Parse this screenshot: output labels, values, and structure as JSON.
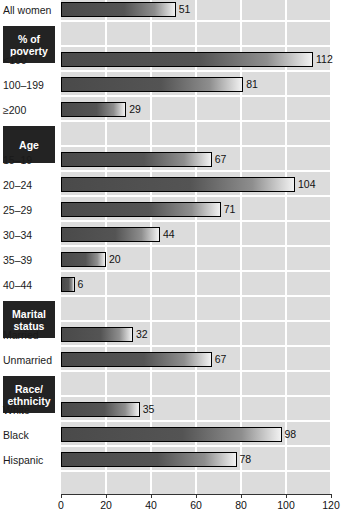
{
  "chart_data": {
    "type": "bar",
    "orientation": "horizontal",
    "title": "",
    "xlabel": "",
    "ylabel": "",
    "xlim": [
      0,
      120
    ],
    "xticks": [
      0,
      20,
      40,
      60,
      80,
      100,
      120
    ],
    "grid": true,
    "legend": null,
    "categories": [
      "All women",
      "<100",
      "100–199",
      "≥200",
      "15–19",
      "20–24",
      "25–29",
      "30–34",
      "35–39",
      "40–44",
      "Married",
      "Unmarried",
      "White",
      "Black",
      "Hispanic"
    ],
    "values": [
      51,
      112,
      81,
      29,
      67,
      104,
      71,
      44,
      20,
      6,
      32,
      67,
      35,
      98,
      78
    ],
    "group_headers": [
      "% of poverty",
      "Age",
      "Marital status",
      "Race/ethnicity"
    ],
    "groups": [
      {
        "header": null,
        "categories": [
          "All women"
        ],
        "values": [
          51
        ]
      },
      {
        "header": "% of poverty",
        "categories": [
          "<100",
          "100–199",
          "≥200"
        ],
        "values": [
          112,
          81,
          29
        ]
      },
      {
        "header": "Age",
        "categories": [
          "15–19",
          "20–24",
          "25–29",
          "30–34",
          "35–39",
          "40–44"
        ],
        "values": [
          67,
          104,
          71,
          44,
          20,
          6
        ]
      },
      {
        "header": "Marital status",
        "categories": [
          "Married",
          "Unmarried"
        ],
        "values": [
          32,
          67
        ]
      },
      {
        "header": "Race/ethnicity",
        "categories": [
          "White",
          "Black",
          "Hispanic"
        ],
        "values": [
          35,
          98,
          78
        ]
      }
    ]
  },
  "rows": [
    {
      "label": "All women",
      "value": "51",
      "kind": "bar"
    },
    {
      "label": "% of poverty",
      "value": "",
      "kind": "header",
      "line1": "% of",
      "line2": "poverty"
    },
    {
      "label": "<100",
      "value": "112",
      "kind": "bar"
    },
    {
      "label": "100–199",
      "value": "81",
      "kind": "bar"
    },
    {
      "label": "≥200",
      "value": "29",
      "kind": "bar"
    },
    {
      "label": "Age",
      "value": "",
      "kind": "header",
      "line1": "Age",
      "line2": ""
    },
    {
      "label": "15–19",
      "value": "67",
      "kind": "bar"
    },
    {
      "label": "20–24",
      "value": "104",
      "kind": "bar"
    },
    {
      "label": "25–29",
      "value": "71",
      "kind": "bar"
    },
    {
      "label": "30–34",
      "value": "44",
      "kind": "bar"
    },
    {
      "label": "35–39",
      "value": "20",
      "kind": "bar"
    },
    {
      "label": "40–44",
      "value": "6",
      "kind": "bar"
    },
    {
      "label": "Marital status",
      "value": "",
      "kind": "header",
      "line1": "Marital",
      "line2": "status"
    },
    {
      "label": "Married",
      "value": "32",
      "kind": "bar"
    },
    {
      "label": "Unmarried",
      "value": "67",
      "kind": "bar"
    },
    {
      "label": "Race/ethnicity",
      "value": "",
      "kind": "header",
      "line1": "Race/",
      "line2": "ethnicity"
    },
    {
      "label": "White",
      "value": "35",
      "kind": "bar"
    },
    {
      "label": "Black",
      "value": "98",
      "kind": "bar"
    },
    {
      "label": "Hispanic",
      "value": "78",
      "kind": "bar"
    }
  ],
  "axis": {
    "ticks": [
      "0",
      "20",
      "40",
      "60",
      "80",
      "100",
      "120"
    ]
  },
  "colors": {
    "plot_background": "#dcdcdc",
    "gridline": "#ffffff",
    "header_box": "#232323",
    "header_text": "#ffffff",
    "bar_dark": "#4a4a4a",
    "bar_light": "#f2f2f2",
    "bar_outline": "#000000",
    "text": "#1a1a1a"
  }
}
